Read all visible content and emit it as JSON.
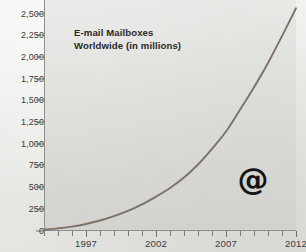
{
  "chart_data": {
    "type": "line",
    "title": "E-mail Mailboxes Worldwide (in millions)",
    "title_lines": [
      "E-mail Mailboxes",
      "Worldwide (in millions)"
    ],
    "xlabel": "",
    "ylabel": "",
    "units": "millions",
    "xlim": [
      1994,
      2012
    ],
    "ylim": [
      0,
      2500
    ],
    "ytick_values": [
      0,
      250,
      500,
      750,
      1000,
      1250,
      1500,
      1750,
      2000,
      2250,
      2500
    ],
    "ytick_labels": [
      "0",
      "250",
      "500",
      "750",
      "1,000",
      "1,250",
      "1,500",
      "1,750",
      "2,000",
      "2,250",
      "2,500"
    ],
    "xtick_values": [
      1994,
      1995,
      1996,
      1997,
      1998,
      1999,
      2000,
      2001,
      2002,
      2003,
      2004,
      2005,
      2006,
      2007,
      2008,
      2009,
      2010,
      2011,
      2012
    ],
    "xtick_labeled": [
      1997,
      2002,
      2007,
      2012
    ],
    "xtick_labels": [
      "1997",
      "2002",
      "2007",
      "2012"
    ],
    "grid": false,
    "legend": false,
    "annotations": [
      {
        "name": "at-symbol",
        "text": "@",
        "x": 2009.4,
        "y": 640
      }
    ],
    "series": [
      {
        "name": "E-mail mailboxes worldwide",
        "color": "#7c7266",
        "x": [
          1994,
          1995,
          1996,
          1997,
          1998,
          1999,
          2000,
          2001,
          2002,
          2003,
          2004,
          2005,
          2006,
          2007,
          2008,
          2009,
          2010,
          2011,
          2012
        ],
        "values": [
          10,
          25,
          45,
          75,
          115,
          165,
          225,
          300,
          390,
          490,
          610,
          760,
          940,
          1140,
          1390,
          1650,
          1930,
          2240,
          2560
        ]
      }
    ]
  },
  "axis": {
    "y_axis_name": "value-axis",
    "x_axis_name": "year-axis"
  }
}
